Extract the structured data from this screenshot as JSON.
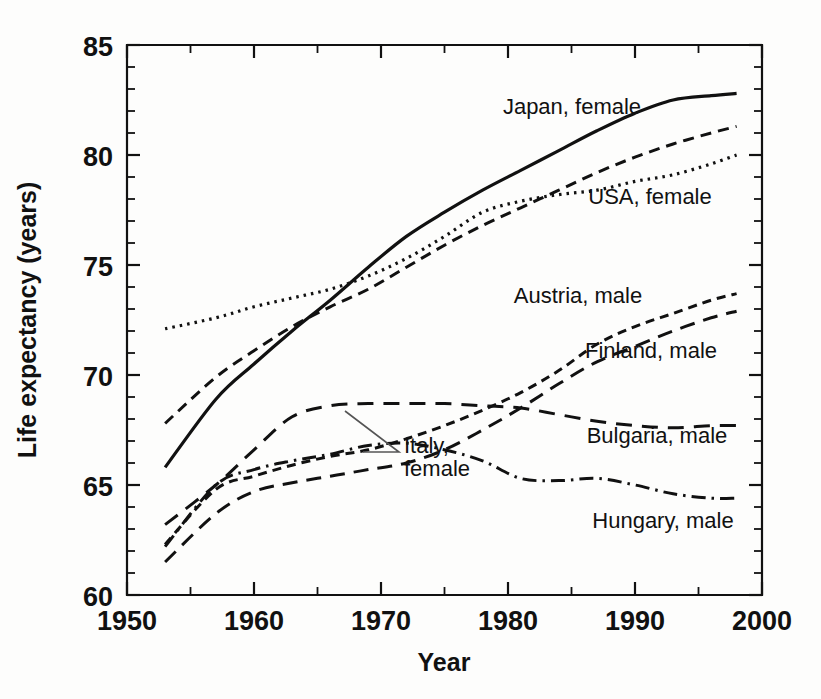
{
  "chart_data": {
    "type": "line",
    "title": "",
    "xlabel": "Year",
    "ylabel": "Life expectancy (years)",
    "xlim": [
      1950,
      2000
    ],
    "ylim": [
      60,
      85
    ],
    "x_major_ticks": [
      1950,
      1960,
      1970,
      1980,
      1990,
      2000
    ],
    "x_minor_interval": 5,
    "y_major_ticks": [
      60,
      65,
      70,
      75,
      80,
      85
    ],
    "y_minor_interval": 1,
    "grid": false,
    "legend": "inline-annotations",
    "x_tick_labels": [
      "1950",
      "1960",
      "1970",
      "1980",
      "1990",
      "2000"
    ],
    "y_tick_labels": [
      "60",
      "65",
      "70",
      "75",
      "80",
      "85"
    ],
    "x": [
      1953,
      1957,
      1960,
      1963,
      1966,
      1969,
      1972,
      1975,
      1978,
      1981,
      1984,
      1987,
      1990,
      1993,
      1996,
      1998
    ],
    "series": [
      {
        "name": "Japan, female",
        "style": "solid",
        "dasharray": "none",
        "width": 3.2,
        "values": [
          65.8,
          68.9,
          70.5,
          72.0,
          73.4,
          74.9,
          76.3,
          77.4,
          78.4,
          79.3,
          80.2,
          81.1,
          81.9,
          82.5,
          82.7,
          82.8
        ]
      },
      {
        "name": "Italy, female",
        "style": "dashed",
        "dasharray": "11,7",
        "width": 3.0,
        "values": [
          67.8,
          69.9,
          71.1,
          72.2,
          73.1,
          73.9,
          74.9,
          75.9,
          76.8,
          77.6,
          78.4,
          79.2,
          79.9,
          80.5,
          81.0,
          81.3
        ]
      },
      {
        "name": "USA, female",
        "style": "dotted",
        "dasharray": "2.5,5",
        "width": 3.2,
        "values": [
          72.1,
          72.6,
          73.1,
          73.5,
          73.9,
          74.5,
          75.3,
          76.3,
          77.4,
          77.9,
          78.2,
          78.4,
          78.8,
          79.1,
          79.6,
          80.0
        ]
      },
      {
        "name": "Austria, male",
        "style": "short-dash",
        "dasharray": "9,6",
        "width": 3.0,
        "values": [
          62.3,
          64.8,
          65.4,
          65.9,
          66.3,
          66.6,
          67.1,
          67.7,
          68.4,
          69.2,
          70.2,
          71.4,
          72.2,
          72.8,
          73.4,
          73.7
        ]
      },
      {
        "name": "Finland, male",
        "style": "long-dash",
        "dasharray": "15,9",
        "width": 3.0,
        "values": [
          61.5,
          63.7,
          64.7,
          65.1,
          65.4,
          65.7,
          66.0,
          66.6,
          67.5,
          68.5,
          69.6,
          70.6,
          71.3,
          72.0,
          72.6,
          72.9
        ]
      },
      {
        "name": "Bulgaria, male",
        "style": "long-dash",
        "dasharray": "16,10",
        "width": 3.0,
        "values": [
          63.2,
          65.0,
          66.6,
          68.1,
          68.6,
          68.7,
          68.7,
          68.7,
          68.6,
          68.5,
          68.2,
          67.9,
          67.7,
          67.6,
          67.7,
          67.7
        ]
      },
      {
        "name": "Hungary, male",
        "style": "dash-dot",
        "dasharray": "14,6,2.5,6",
        "width": 3.0,
        "values": [
          62.2,
          65.0,
          65.7,
          66.1,
          66.4,
          66.8,
          66.9,
          66.6,
          66.1,
          65.3,
          65.2,
          65.3,
          65.0,
          64.6,
          64.4,
          64.4
        ]
      }
    ],
    "annotations": [
      {
        "text": "Japan, female",
        "x": 1971.5,
        "y": 81.4,
        "anchor": "middle",
        "leader": false
      },
      {
        "text": "USA, female",
        "x": 1985.5,
        "y": 77.3,
        "anchor": "middle",
        "leader": false
      },
      {
        "text": "Italy, female",
        "x": 1969.0,
        "y": 70.5,
        "anchor": "start",
        "leader": true
      },
      {
        "text": "female",
        "x": 1969.0,
        "y": 69.5,
        "anchor": "start",
        "leader": false
      },
      {
        "text": "Austria, male",
        "x": 1977.5,
        "y": 72.9,
        "anchor": "middle",
        "leader": false
      },
      {
        "text": "Finland, male",
        "x": 1986.5,
        "y": 70.4,
        "anchor": "middle",
        "leader": false
      },
      {
        "text": "Bulgaria, male",
        "x": 1987.0,
        "y": 66.3,
        "anchor": "middle",
        "leader": false
      },
      {
        "text": "Hungary, male",
        "x": 1987.5,
        "y": 63.0,
        "anchor": "middle",
        "leader": false
      }
    ],
    "colors": {
      "line": "#111111",
      "axis": "#111111",
      "background": "#fdfdfc",
      "leader": "#555555"
    }
  },
  "labels": {
    "y_axis_title": "Life expectancy (years)",
    "x_axis_title": "Year",
    "japan_female": "Japan, female",
    "usa_female": "USA, female",
    "italy_female_line1": "Italy,",
    "italy_female_line2": "female",
    "austria_male": "Austria, male",
    "finland_male": "Finland, male",
    "bulgaria_male": "Bulgaria, male",
    "hungary_male": "Hungary, male",
    "y_85": "85",
    "y_80": "80",
    "y_75": "75",
    "y_70": "70",
    "y_65": "65",
    "y_60": "60",
    "x_1950": "1950",
    "x_1960": "1960",
    "x_1970": "1970",
    "x_1980": "1980",
    "x_1990": "1990",
    "x_2000": "2000"
  }
}
